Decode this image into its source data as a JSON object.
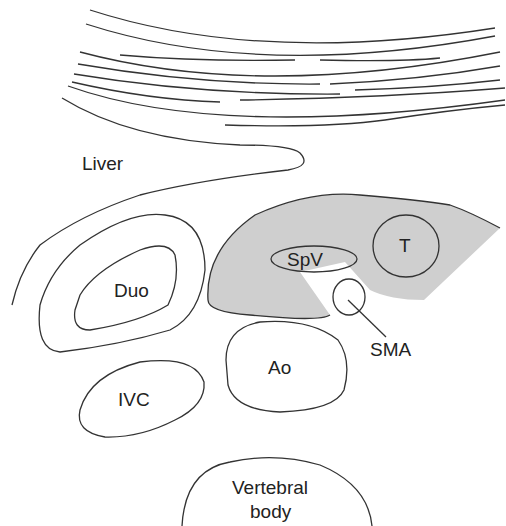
{
  "diagram": {
    "labels": {
      "liver": "Liver",
      "duodenum": "Duo",
      "splenic_vein": "SpV",
      "tumour": "T",
      "sma": "SMA",
      "aorta": "Ao",
      "ivc": "IVC",
      "vertebral_line1": "Vertebral",
      "vertebral_line2": "body"
    },
    "colors": {
      "stroke": "#333333",
      "pancreas_fill": "#cfcfcf",
      "background": "#ffffff"
    }
  }
}
